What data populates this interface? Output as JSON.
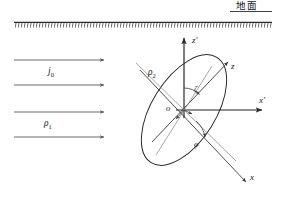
{
  "figure": {
    "width": 283,
    "height": 200,
    "background": "#ffffff",
    "line_color": "#2b2b2b",
    "thin_line_color": "#6e6e6e",
    "text_color": "#1a1a1a"
  },
  "ground": {
    "label": "地面",
    "hatching": "dense-diagonal",
    "line_y": 22,
    "line_x_start": 14,
    "line_x_end": 272
  },
  "current_arrows": {
    "count": 4,
    "direction": "right",
    "label_current": "j",
    "label_current_sub": "0",
    "label_resistivity": "ρ",
    "label_resistivity_sub": "1",
    "rows_y": [
      60,
      85,
      112,
      137
    ],
    "x_start": 14,
    "x_end": 106
  },
  "ellipse": {
    "label": "ρ",
    "label_sub": "2",
    "center_x": 184,
    "center_y": 110,
    "semi_major": 62,
    "semi_minor": 32,
    "rotation_deg": -58
  },
  "axes": {
    "primed": {
      "z_label": "z",
      "z_prime": "′",
      "x_label": "x",
      "x_prime": "′",
      "origin_label": "o"
    },
    "rotated": {
      "z_label": "z",
      "x_label": "x"
    }
  },
  "angles": {
    "upper": "ζ",
    "lower": "φ"
  }
}
